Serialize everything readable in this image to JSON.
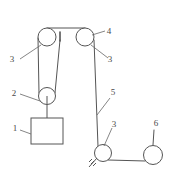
{
  "figure": {
    "type": "line-diagram",
    "width": 178,
    "height": 188,
    "background_color": "#ffffff",
    "stroke_color": "#555555"
  },
  "labels": [
    {
      "id": "label-1",
      "text": "1",
      "x": 15,
      "y": 131,
      "refers_to": "hanging-block"
    },
    {
      "id": "label-2",
      "text": "2",
      "x": 14,
      "y": 96,
      "refers_to": "movable-pulley"
    },
    {
      "id": "label-3a",
      "text": "3",
      "x": 12,
      "y": 62,
      "refers_to": "top-left-pulley"
    },
    {
      "id": "label-3b",
      "text": "3",
      "x": 110,
      "y": 62,
      "refers_to": "top-right-pulley"
    },
    {
      "id": "label-3c",
      "text": "3",
      "x": 114,
      "y": 127,
      "refers_to": "bottom-pulley"
    },
    {
      "id": "label-4",
      "text": "4",
      "x": 109,
      "y": 34,
      "refers_to": "top-right-pulley-axle"
    },
    {
      "id": "label-5",
      "text": "5",
      "x": 113,
      "y": 95,
      "refers_to": "vertical-rope"
    },
    {
      "id": "label-6",
      "text": "6",
      "x": 156,
      "y": 126,
      "refers_to": "right-circle"
    }
  ],
  "components": {
    "top_left_pulley": {
      "name": "top-left-pulley",
      "cx": 47,
      "cy": 37,
      "r": 9
    },
    "top_right_pulley": {
      "name": "top-right-pulley",
      "cx": 85,
      "cy": 37,
      "r": 9
    },
    "movable_pulley": {
      "name": "movable-pulley",
      "cx": 47,
      "cy": 96,
      "r": 8.5
    },
    "bottom_pulley": {
      "name": "bottom-pulley",
      "cx": 103,
      "cy": 153,
      "r": 8.5
    },
    "right_circle": {
      "name": "right-circle",
      "cx": 153,
      "cy": 155,
      "r": 9.5
    },
    "hanging_block": {
      "name": "hanging-block",
      "x": 31,
      "y": 118,
      "width": 32,
      "height": 26
    },
    "ground_anchor": {
      "name": "ground-anchor",
      "x": 90,
      "y": 159
    },
    "rope_anchor_tick": {
      "name": "rope-anchor-tick",
      "x": 60,
      "y": 32,
      "length": 9
    }
  }
}
